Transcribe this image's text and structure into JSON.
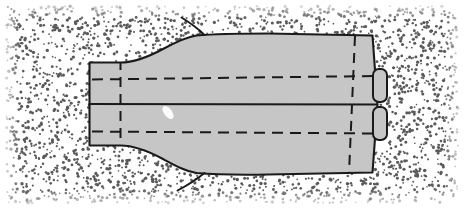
{
  "figure": {
    "width": 464,
    "height": 213
  },
  "colors": {
    "background": "#ffffff",
    "stipple_dot": "#5a5a5a",
    "body_fill": "#c6c6c6",
    "body_outline": "#1a1a1a",
    "dashed_line": "#1a1a1a",
    "seam_line": "#1a1a1a",
    "highlight": "#ffffff",
    "frame": "#9a9a9a"
  },
  "geometry": {
    "stipple": {
      "label": "stipple-field",
      "seed": 20240711,
      "count": 2100,
      "dot_radius_min": 0.8,
      "dot_radius_max": 1.7,
      "margin_left": 6,
      "margin_top": 6,
      "margin_right": 6,
      "margin_bottom": 10
    },
    "body_outline_path": "M 89.5 62.5 L 120.5 62.5 C 136 62.5 150 56 163 49 C 176 42 186 37 196.5 35.5 C 214 34 240 33.5 268 33.5 L 372.5 35.5 L 377.5 104.5 L 372.5 172.5 L 268 174.5 C 240 175 214 174.5 196.5 173 C 186 171.5 176 166 163 159 C 150 152 136 145.5 120.5 145.5 L 89.5 145.5 Z",
    "neck": {
      "label": "left-neck-cylinder",
      "x_left": 89.5,
      "x_right": 120.5,
      "y_top": 62.5,
      "y_bottom": 145.5
    },
    "seam_line": {
      "label": "horizontal-seam",
      "x1": 89.5,
      "y1": 104.0,
      "x2": 378.0,
      "y2": 104.5,
      "width": 2.2
    },
    "dashed_horizontal_upper": {
      "label": "upper-hidden-line",
      "x1": 92.0,
      "y1": 79.5,
      "x2": 376.0,
      "y2": 76.0
    },
    "dashed_horizontal_lower": {
      "label": "lower-hidden-line",
      "x1": 92.0,
      "y1": 131.5,
      "x2": 376.0,
      "y2": 133.5
    },
    "dashed_vertical_left": {
      "label": "left-section-line",
      "x1": 120.5,
      "y1": 60.0,
      "x2": 120.5,
      "y2": 148.0
    },
    "dashed_vertical_right": {
      "label": "right-section-line",
      "x1": 355.0,
      "y1": 36.0,
      "x2": 349.0,
      "y2": 173.0
    },
    "tube_stub_upper": {
      "label": "upper-tube-stub",
      "x": 373.0,
      "y": 69.0,
      "width": 14.0,
      "height": 33.0,
      "corner_radius": 6.0
    },
    "tube_stub_lower": {
      "label": "lower-tube-stub",
      "x": 373.0,
      "y": 107.0,
      "width": 14.0,
      "height": 33.0,
      "corner_radius": 6.0
    },
    "whisker_upper": {
      "label": "upper-whisker",
      "path": "M 204.5 35.0 C 200 30.5 192 24 181.5 17.5"
    },
    "whisker_lower": {
      "label": "lower-whisker",
      "path": "M 204.5 173.0 C 199 177.5 190 184 177.5 190.5"
    },
    "highlight_spot": {
      "label": "surface-highlight",
      "cx": 168.0,
      "cy": 112.5,
      "rx": 4.0,
      "ry": 7.5,
      "rotation": -38
    }
  }
}
